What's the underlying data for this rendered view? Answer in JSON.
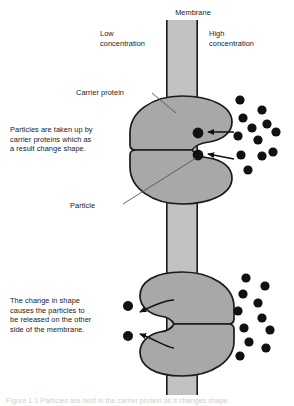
{
  "figure": {
    "caption": "Figure 1.1 Particles are held in the carrier protein as it changes shape."
  },
  "labels": {
    "membrane": "Membrane",
    "low_concentration": "Low\nconcentration",
    "high_concentration": "High\nconcentration",
    "carrier_protein": "Carrier protein",
    "particle": "Particle"
  },
  "annotations": {
    "uptake": "Particles are taken up by\ncarrier proteins which as\na result change shape.",
    "release": "The change in shape\ncauses the particles to\nbe released on the other\nside of the membrane."
  },
  "colors": {
    "membrane_fill": "#c2c2c2",
    "membrane_stroke": "#1a1a1a",
    "protein_fill": "#a8a8a8",
    "protein_stroke": "#1a1a1a",
    "particle_fill": "#111111",
    "leader_line": "#555555",
    "text": "#1a1a1a",
    "background": "#ffffff"
  },
  "geometry": {
    "membrane": {
      "x": 166,
      "y": 20,
      "width": 32,
      "height": 375
    },
    "upper_protein": {
      "cx": 182,
      "cy": 148,
      "opening": "right"
    },
    "lower_protein": {
      "cx": 182,
      "cy": 322,
      "opening": "left"
    }
  },
  "particles": {
    "upper_pocket": [
      {
        "cx": 198,
        "cy": 133,
        "r": 5.4
      },
      {
        "cx": 198,
        "cy": 155,
        "r": 5.4
      }
    ],
    "upper_right_cluster": [
      {
        "cx": 240,
        "cy": 100,
        "r": 4.6
      },
      {
        "cx": 262,
        "cy": 110,
        "r": 4.6
      },
      {
        "cx": 243,
        "cy": 118,
        "r": 4.6
      },
      {
        "cx": 267,
        "cy": 124,
        "r": 4.6
      },
      {
        "cx": 252,
        "cy": 128,
        "r": 4.6
      },
      {
        "cx": 238,
        "cy": 136,
        "r": 4.6
      },
      {
        "cx": 258,
        "cy": 140,
        "r": 4.6
      },
      {
        "cx": 276,
        "cy": 132,
        "r": 4.6
      },
      {
        "cx": 241,
        "cy": 155,
        "r": 4.6
      },
      {
        "cx": 262,
        "cy": 156,
        "r": 4.6
      },
      {
        "cx": 248,
        "cy": 170,
        "r": 4.6
      },
      {
        "cx": 273,
        "cy": 152,
        "r": 4.6
      }
    ],
    "lower_left_released": [
      {
        "cx": 128,
        "cy": 306,
        "r": 5.0
      },
      {
        "cx": 128,
        "cy": 336,
        "r": 5.0
      }
    ],
    "lower_right_cluster": [
      {
        "cx": 246,
        "cy": 278,
        "r": 4.6
      },
      {
        "cx": 265,
        "cy": 286,
        "r": 4.6
      },
      {
        "cx": 243,
        "cy": 294,
        "r": 4.6
      },
      {
        "cx": 258,
        "cy": 303,
        "r": 4.6
      },
      {
        "cx": 238,
        "cy": 311,
        "r": 4.6
      },
      {
        "cx": 262,
        "cy": 318,
        "r": 4.6
      },
      {
        "cx": 244,
        "cy": 328,
        "r": 4.6
      },
      {
        "cx": 270,
        "cy": 330,
        "r": 4.6
      },
      {
        "cx": 249,
        "cy": 342,
        "r": 4.6
      },
      {
        "cx": 266,
        "cy": 348,
        "r": 4.6
      },
      {
        "cx": 240,
        "cy": 356,
        "r": 4.6
      }
    ]
  },
  "arrows": {
    "uptake_in": [
      {
        "from_x": 232,
        "from_y": 133,
        "to_x": 207,
        "to_y": 133,
        "style": "straight"
      },
      {
        "from_x": 232,
        "from_y": 157,
        "to_x": 207,
        "to_y": 155,
        "style": "straight"
      }
    ],
    "release_out": [
      {
        "from_x": 172,
        "from_y": 300,
        "to_x": 138,
        "to_y": 312,
        "style": "curved"
      },
      {
        "from_x": 172,
        "from_y": 344,
        "to_x": 138,
        "to_y": 334,
        "style": "curved"
      }
    ]
  },
  "leader_lines": {
    "carrier_protein": {
      "x1": 152,
      "y1": 93,
      "x2": 176,
      "y2": 113
    },
    "particle": {
      "x1": 123,
      "y1": 204,
      "x2": 196,
      "y2": 158
    }
  }
}
